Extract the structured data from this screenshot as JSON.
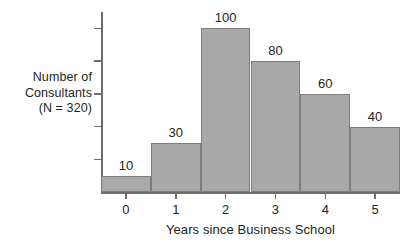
{
  "chart_data": {
    "type": "bar",
    "title": "",
    "subtitle": "",
    "categories": [
      "0",
      "1",
      "2",
      "3",
      "4",
      "5"
    ],
    "values": [
      10,
      30,
      100,
      80,
      60,
      40
    ],
    "data_labels": [
      "10",
      "30",
      "100",
      "80",
      "60",
      "40"
    ],
    "xlabel": "Years since Business School",
    "ylabel": "Number of Consultants (N = 320)",
    "ylabel_lines": [
      "Number of",
      "Consultants",
      "(N = 320)"
    ],
    "xlim": [
      -0.5,
      5.5
    ],
    "ylim": [
      0,
      110
    ],
    "y_ticks": [
      20,
      40,
      60,
      80,
      100
    ],
    "y_tick_labels": [],
    "grid": false,
    "legend": false,
    "legend_position": "none",
    "bar_gap": 0,
    "colors": {
      "bar_fill": "#a8a8a8",
      "bar_border": "#7d7d7d",
      "axis": "#6e6e6e",
      "text": "#231f20",
      "background": "#ffffff"
    },
    "total_n": 320
  }
}
